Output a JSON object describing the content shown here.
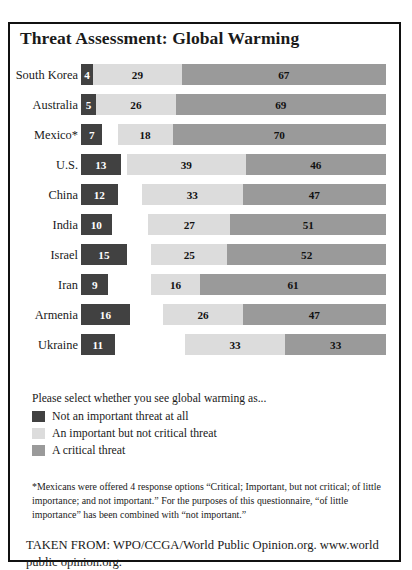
{
  "title": "Threat Assessment: Global Warming",
  "chart_data": {
    "type": "bar",
    "subtype": "stacked-horizontal",
    "title": "Threat Assessment: Global Warming",
    "xlabel": "",
    "ylabel": "",
    "xlim": [
      0,
      100
    ],
    "grid": false,
    "legend_position": "below-plot",
    "note": "Bars are right-aligned; segment widths are proportional to percentage values. Rows do not all sum to 100.",
    "categories": [
      "South Korea",
      "Australia",
      "Mexico*",
      "U.S.",
      "China",
      "India",
      "Israel",
      "Iran",
      "Armenia",
      "Ukraine"
    ],
    "series": [
      {
        "name": "Not an important threat at all",
        "color": "#414141",
        "values": [
          4,
          5,
          7,
          13,
          12,
          10,
          15,
          9,
          16,
          11
        ]
      },
      {
        "name": "An important but not critical threat",
        "color": "#dcdcdc",
        "values": [
          29,
          26,
          18,
          39,
          33,
          27,
          25,
          16,
          26,
          33
        ]
      },
      {
        "name": "A critical threat",
        "color": "#9a9a9a",
        "values": [
          67,
          69,
          70,
          46,
          47,
          51,
          52,
          61,
          47,
          33
        ]
      }
    ]
  },
  "legend": {
    "prompt": "Please select whether you see global warming as...",
    "items": [
      {
        "label": "Not an important threat at all",
        "color": "#414141"
      },
      {
        "label": "An important but not critical threat",
        "color": "#dcdcdc"
      },
      {
        "label": "A critical threat",
        "color": "#9a9a9a"
      }
    ]
  },
  "footnote": "*Mexicans were offered 4 response options “Critical; Important, but not critical; of little importance; and not important.” For the purposes of this questionnaire, “of little importance” has been combined with “not important.”",
  "source": "TAKEN FROM: WPO/CCGA/World Public Opinion.org. www.world public opinion.org."
}
